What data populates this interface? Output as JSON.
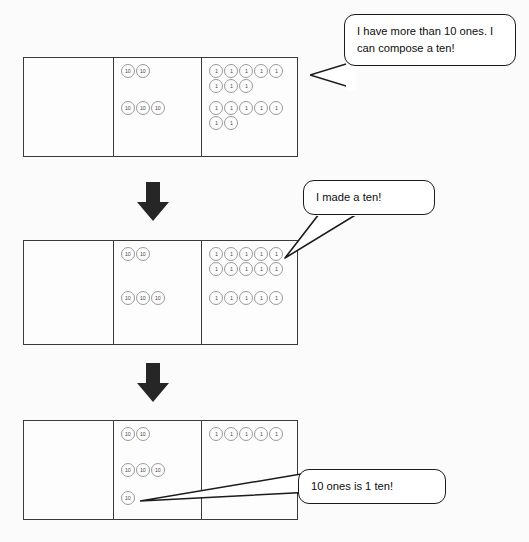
{
  "chart_data": {
    "type": "table",
    "columns": [
      "hundreds",
      "tens",
      "ones"
    ],
    "disc_labels": {
      "hundreds": "100",
      "tens": "10",
      "ones": "1"
    },
    "steps": [
      {
        "step": 1,
        "caption": "I have more than 10 ones.  I can compose a ten!",
        "hundreds": [],
        "tens": [
          2,
          3
        ],
        "ones": [
          8,
          7
        ],
        "tens_total": 5,
        "ones_total": 15
      },
      {
        "step": 2,
        "caption": "I made a ten!",
        "hundreds": [],
        "tens": [
          2,
          3
        ],
        "ones": [
          10,
          5
        ],
        "tens_total": 5,
        "ones_total": 15
      },
      {
        "step": 3,
        "caption": "10 ones is 1 ten!",
        "hundreds": [],
        "tens": [
          2,
          3,
          1
        ],
        "ones": [
          5
        ],
        "tens_total": 6,
        "ones_total": 5
      }
    ]
  },
  "charts": [
    {
      "name": "chart-step-1",
      "hundreds_groups": [],
      "tens_groups": [
        {
          "top": 6,
          "count": 2,
          "per_row": 5,
          "label": "10"
        },
        {
          "top": 43,
          "count": 3,
          "per_row": 5,
          "label": "10"
        }
      ],
      "ones_groups": [
        {
          "top": 6,
          "count": 8,
          "per_row": 5,
          "label": "1"
        },
        {
          "top": 43,
          "count": 7,
          "per_row": 5,
          "label": "1"
        }
      ]
    },
    {
      "name": "chart-step-2",
      "hundreds_groups": [],
      "tens_groups": [
        {
          "top": 6,
          "count": 2,
          "per_row": 5,
          "label": "10"
        },
        {
          "top": 50,
          "count": 3,
          "per_row": 5,
          "label": "10"
        }
      ],
      "ones_groups": [
        {
          "top": 6,
          "count": 10,
          "per_row": 5,
          "label": "1"
        },
        {
          "top": 50,
          "count": 5,
          "per_row": 5,
          "label": "1"
        }
      ]
    },
    {
      "name": "chart-step-3",
      "hundreds_groups": [],
      "tens_groups": [
        {
          "top": 6,
          "count": 2,
          "per_row": 5,
          "label": "10"
        },
        {
          "top": 42,
          "count": 3,
          "per_row": 5,
          "label": "10"
        },
        {
          "top": 70,
          "count": 1,
          "per_row": 5,
          "label": "10"
        }
      ],
      "ones_groups": [
        {
          "top": 6,
          "count": 5,
          "per_row": 5,
          "label": "1"
        }
      ]
    }
  ],
  "bubbles": {
    "bubble_1": "I have more than 10 ones.  I can compose a ten!",
    "bubble_2": "I made a ten!",
    "bubble_3": "10 ones is 1 ten!"
  },
  "arrows": {
    "arrow_1_direction": "down",
    "arrow_2_direction": "down"
  },
  "colors": {
    "background": "#fbfbfb",
    "chart_border": "#3a3a3a",
    "disc_border": "#9a9a9a",
    "bubble_border": "#1b1b1b",
    "arrow_fill": "#262626",
    "text": "#0d0d0d"
  }
}
